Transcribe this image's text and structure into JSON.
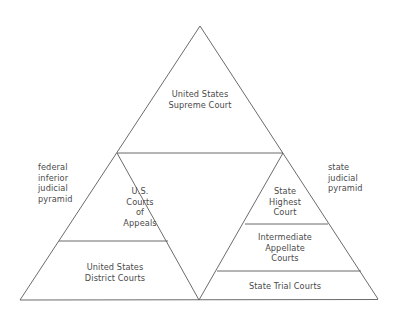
{
  "diagram": {
    "colors": {
      "line": "#5a5a5a",
      "text": "#4a4a4a",
      "background": "#ffffff"
    },
    "apex": {
      "label_lines": [
        "United States",
        "Supreme Court"
      ]
    },
    "federal": {
      "side_label_lines": [
        "federal",
        "inferior",
        "judicial",
        "pyramid"
      ],
      "tiers": [
        {
          "label_lines": [
            "U.S.",
            "Courts",
            "of",
            "Appeals"
          ]
        },
        {
          "label_lines": [
            "United States",
            "District Courts"
          ]
        }
      ]
    },
    "state": {
      "side_label_lines": [
        "state",
        "judicial",
        "pyramid"
      ],
      "tiers": [
        {
          "label_lines": [
            "State",
            "Highest",
            "Court"
          ]
        },
        {
          "label_lines": [
            "Intermediate",
            "Appellate",
            "Courts"
          ]
        },
        {
          "label_lines": [
            "State Trial Courts"
          ]
        }
      ]
    }
  }
}
